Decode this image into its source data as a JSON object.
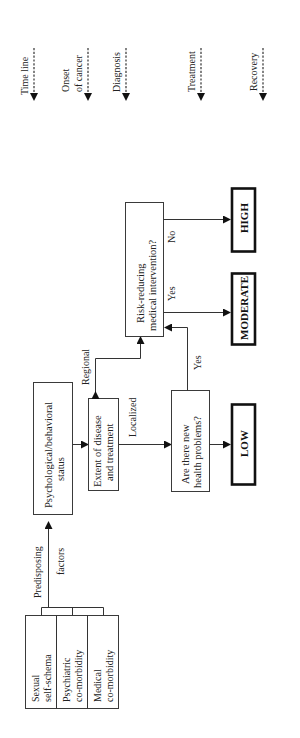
{
  "timeline": {
    "items": [
      {
        "label": "Time line",
        "lines": [
          "Time line"
        ]
      },
      {
        "label": "Onset of cancer",
        "lines": [
          "Onset",
          "of cancer"
        ]
      },
      {
        "label": "Diagnosis",
        "lines": [
          "Diagnosis"
        ]
      },
      {
        "label": "Treatment",
        "lines": [
          "Treatment"
        ]
      },
      {
        "label": "Recovery",
        "lines": [
          "Recovery"
        ]
      }
    ]
  },
  "factors": {
    "label_line1": "Predisposing",
    "label_line2": "factors",
    "items": [
      {
        "line1": "Sexual",
        "line2": "self-schema"
      },
      {
        "line1": "Psychiatric",
        "line2": "co-morbidity"
      },
      {
        "line1": "Medical",
        "line2": "co-morbidity"
      }
    ]
  },
  "nodes": {
    "psych": {
      "line1": "Psychological/behavioral",
      "line2": "status"
    },
    "extent": {
      "line1": "Extent of disease",
      "line2": "and treatment"
    },
    "health": {
      "line1": "Are there new",
      "line2": "health problems?"
    },
    "risk": {
      "line1": "Risk-reducing",
      "line2": "medical intervention?"
    }
  },
  "edges": {
    "regional": "Regional",
    "localized": "Localized",
    "yes_health": "Yes",
    "yes_risk": "Yes",
    "no_risk": "No"
  },
  "outcomes": {
    "low": "LOW",
    "moderate": "MODERATE",
    "high": "HIGH"
  }
}
